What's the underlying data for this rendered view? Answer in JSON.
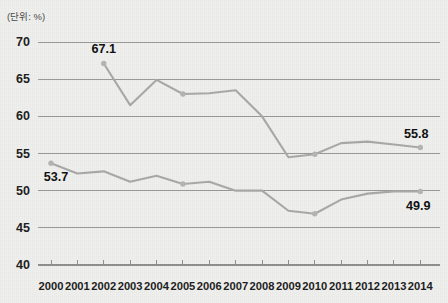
{
  "unit_note": "(단위: %)",
  "chart_data": {
    "type": "line",
    "title": "",
    "subtitle": "",
    "xlabel": "",
    "ylabel": "",
    "unit_note": "(단위: %)",
    "grid": true,
    "legend": "none",
    "ylim": [
      40,
      70
    ],
    "y_ticks": [
      40,
      45,
      50,
      55,
      60,
      65,
      70
    ],
    "categories": [
      "2000",
      "2001",
      "2002",
      "2003",
      "2004",
      "2005",
      "2006",
      "2007",
      "2008",
      "2009",
      "2010",
      "2011",
      "2012",
      "2013",
      "2014"
    ],
    "x": [
      2000,
      2001,
      2002,
      2003,
      2004,
      2005,
      2006,
      2007,
      2008,
      2009,
      2010,
      2011,
      2012,
      2013,
      2014
    ],
    "series": [
      {
        "name": "upper-series",
        "color": "#a8a8a8",
        "values": [
          null,
          null,
          67.1,
          61.5,
          64.9,
          63.0,
          63.1,
          63.5,
          60.0,
          54.5,
          54.9,
          56.4,
          56.6,
          56.2,
          55.8
        ]
      },
      {
        "name": "lower-series",
        "color": "#a8a8a8",
        "values": [
          53.7,
          52.3,
          52.6,
          51.2,
          52.0,
          50.9,
          51.2,
          50.0,
          50.0,
          47.3,
          46.9,
          48.8,
          49.6,
          49.9,
          49.9
        ]
      }
    ],
    "annotations": [
      {
        "text": "67.1",
        "series": "upper-series",
        "x": 2002,
        "y": 67.1,
        "position": "above"
      },
      {
        "text": "53.7",
        "series": "lower-series",
        "x": 2000,
        "y": 53.7,
        "position": "below-right"
      },
      {
        "text": "55.8",
        "series": "upper-series",
        "x": 2014,
        "y": 55.8,
        "position": "above-left"
      },
      {
        "text": "49.9",
        "series": "lower-series",
        "x": 2014,
        "y": 49.9,
        "position": "below-left"
      }
    ],
    "markers": [
      {
        "series": "upper-series",
        "x": 2002
      },
      {
        "series": "upper-series",
        "x": 2005
      },
      {
        "series": "upper-series",
        "x": 2010
      },
      {
        "series": "upper-series",
        "x": 2014
      },
      {
        "series": "lower-series",
        "x": 2000
      },
      {
        "series": "lower-series",
        "x": 2005
      },
      {
        "series": "lower-series",
        "x": 2010
      },
      {
        "series": "lower-series",
        "x": 2014
      }
    ],
    "colors": {
      "background": "#efefed",
      "gridline": "#8f8f8f",
      "axis": "#8f8f8f",
      "line": "#a8a8a8",
      "marker": "#b4b4b4",
      "text": "#1e1e1e"
    }
  }
}
